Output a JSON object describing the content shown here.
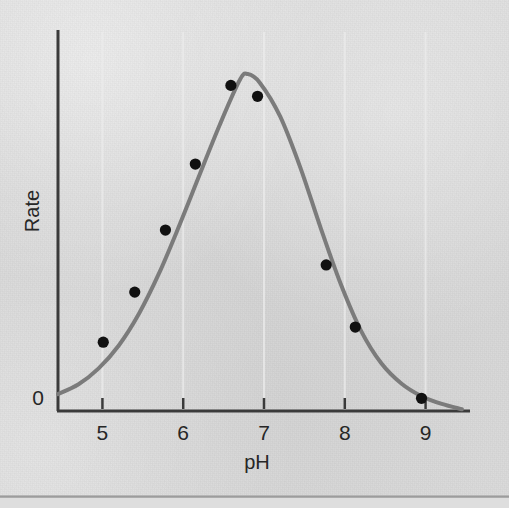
{
  "figure": {
    "background_color": "#d8d8d8",
    "axis_color": "#3a3a3a",
    "curve_color": "#7b7b7b",
    "point_color": "#111111",
    "gridline_color": "#ececec",
    "origin_label": "0"
  },
  "chart_data": {
    "type": "scatter",
    "title": "",
    "subtitle": "",
    "xlabel": "pH",
    "ylabel": "Rate",
    "xlim": [
      4.45,
      9.55
    ],
    "ylim": [
      0,
      1.08
    ],
    "xticks": [
      5,
      6,
      7,
      8,
      9
    ],
    "xticklabels": [
      "5",
      "6",
      "7",
      "8",
      "9"
    ],
    "yticks": [
      0
    ],
    "yticklabels": [
      "0"
    ],
    "grid": "faint vertical gridlines at x ticks",
    "legend": "none",
    "annotations": [],
    "series": [
      {
        "name": "Measured rate",
        "marker": "filled-circle",
        "points": [
          {
            "x": 5.01,
            "y": 0.195
          },
          {
            "x": 5.4,
            "y": 0.337
          },
          {
            "x": 5.78,
            "y": 0.513
          },
          {
            "x": 6.15,
            "y": 0.7
          },
          {
            "x": 6.59,
            "y": 0.923
          },
          {
            "x": 6.92,
            "y": 0.892
          },
          {
            "x": 7.77,
            "y": 0.414
          },
          {
            "x": 8.13,
            "y": 0.238
          },
          {
            "x": 8.95,
            "y": 0.036
          }
        ]
      },
      {
        "name": "Fitted bell curve",
        "marker": "none",
        "style": "solid-line",
        "peak_x": 6.75,
        "peak_y": 0.955,
        "curve_points": [
          {
            "x": 4.45,
            "y": 0.048
          },
          {
            "x": 4.7,
            "y": 0.075
          },
          {
            "x": 4.95,
            "y": 0.12
          },
          {
            "x": 5.2,
            "y": 0.185
          },
          {
            "x": 5.45,
            "y": 0.275
          },
          {
            "x": 5.7,
            "y": 0.39
          },
          {
            "x": 5.95,
            "y": 0.525
          },
          {
            "x": 6.2,
            "y": 0.668
          },
          {
            "x": 6.45,
            "y": 0.81
          },
          {
            "x": 6.7,
            "y": 0.938
          },
          {
            "x": 6.8,
            "y": 0.955
          },
          {
            "x": 6.95,
            "y": 0.93
          },
          {
            "x": 7.2,
            "y": 0.835
          },
          {
            "x": 7.45,
            "y": 0.69
          },
          {
            "x": 7.7,
            "y": 0.52
          },
          {
            "x": 7.95,
            "y": 0.36
          },
          {
            "x": 8.2,
            "y": 0.228
          },
          {
            "x": 8.45,
            "y": 0.136
          },
          {
            "x": 8.7,
            "y": 0.078
          },
          {
            "x": 8.95,
            "y": 0.042
          },
          {
            "x": 9.2,
            "y": 0.02
          },
          {
            "x": 9.45,
            "y": 0.005
          }
        ]
      }
    ]
  }
}
